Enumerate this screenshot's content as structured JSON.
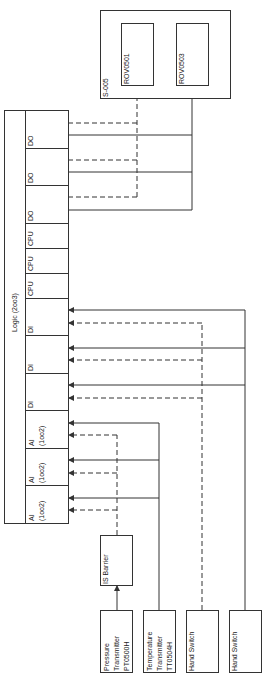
{
  "diagram": {
    "orientation": "rotated-90-ccw",
    "logic_solver": {
      "title": "Logic (2oo3)",
      "modules": [
        {
          "type": "DO",
          "label": "DO"
        },
        {
          "type": "DO",
          "label": "DO"
        },
        {
          "type": "DO",
          "label": "DO"
        },
        {
          "type": "CPU",
          "label": "CPU"
        },
        {
          "type": "CPU",
          "label": "CPU"
        },
        {
          "type": "CPU",
          "label": "CPU"
        },
        {
          "type": "DI",
          "label": "DI"
        },
        {
          "type": "DI",
          "label": "DI"
        },
        {
          "type": "DI",
          "label": "DI"
        },
        {
          "type": "AI",
          "label": "AI\n(1oo2)"
        },
        {
          "type": "AI",
          "label": "AI\n(1oo2)"
        },
        {
          "type": "AI",
          "label": "AI\n(1oo2)"
        }
      ]
    },
    "final_elements_group": {
      "title": "S-005",
      "items": [
        {
          "id": "rov0501",
          "label": "ROV0501"
        },
        {
          "id": "rov0503",
          "label": "ROV0503"
        }
      ]
    },
    "is_barrier": {
      "label": "IS Barrier"
    },
    "field_devices": [
      {
        "id": "pt0500h",
        "label": "Pressure\nTransmitter\nPT0500H",
        "line": "dashed",
        "via": "IS Barrier"
      },
      {
        "id": "tt0504h",
        "label": "Temperature\nTransmitter\nTT0504H",
        "line": "solid"
      },
      {
        "id": "hs1",
        "label": "Hand Switch",
        "line": "dashed"
      },
      {
        "id": "hs2",
        "label": "Hand Switch",
        "line": "solid"
      }
    ],
    "connections": [
      {
        "from": "PT0500H",
        "to": "IS Barrier",
        "style": "solid"
      },
      {
        "from": "IS Barrier",
        "to": "AI (1oo2) x3",
        "style": "dashed"
      },
      {
        "from": "TT0504H",
        "to": "AI (1oo2) x3",
        "style": "solid"
      },
      {
        "from": "Hand Switch 1",
        "to": "DI x3",
        "style": "dashed"
      },
      {
        "from": "Hand Switch 2",
        "to": "DI x3",
        "style": "solid"
      },
      {
        "from": "DO x3",
        "to": "ROV0501",
        "style": "dashed"
      },
      {
        "from": "DO x3",
        "to": "ROV0503",
        "style": "solid"
      }
    ],
    "colors": {
      "line": "#333333",
      "background": "#ffffff"
    }
  }
}
